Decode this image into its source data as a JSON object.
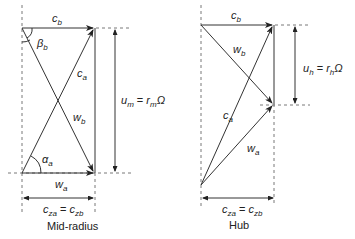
{
  "diagram": {
    "mid_radius": {
      "caption": "Mid-radius",
      "labels": {
        "c_b": {
          "main": "c",
          "sub": "b"
        },
        "beta_b": {
          "main": "β",
          "sub": "b"
        },
        "c_a": {
          "main": "c",
          "sub": "a"
        },
        "w_b": {
          "main": "w",
          "sub": "b"
        },
        "alpha_a": {
          "main": "α",
          "sub": "a"
        },
        "w_a": {
          "main": "w",
          "sub": "a"
        },
        "u": {
          "lhs_main": "u",
          "lhs_sub": "m",
          "eq": " = ",
          "rhs_main": "r",
          "rhs_sub": "m",
          "omega": "Ω"
        },
        "cz": {
          "a_main": "c",
          "a_sub": "za",
          "eq": " = ",
          "b_main": "c",
          "b_sub": "zb"
        }
      }
    },
    "hub": {
      "caption": "Hub",
      "labels": {
        "c_b": {
          "main": "c",
          "sub": "b"
        },
        "w_b": {
          "main": "w",
          "sub": "b"
        },
        "c_a": {
          "main": "c",
          "sub": "a"
        },
        "w_a": {
          "main": "w",
          "sub": "a"
        },
        "u": {
          "lhs_main": "u",
          "lhs_sub": "h",
          "eq": " = ",
          "rhs_main": "r",
          "rhs_sub": "h",
          "omega": "Ω"
        },
        "cz": {
          "a_main": "c",
          "a_sub": "za",
          "eq": " = ",
          "b_main": "c",
          "b_sub": "zb"
        }
      }
    }
  }
}
